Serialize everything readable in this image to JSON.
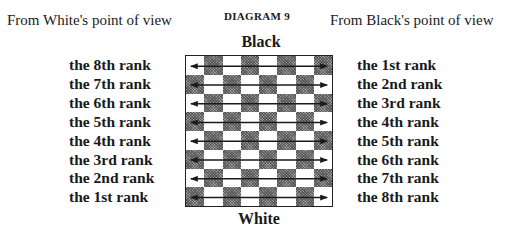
{
  "diagram": {
    "title": "DIAGRAM 9",
    "top_side_label": "Black",
    "bottom_side_label": "White",
    "left_header": "From White's point of view",
    "right_header": "From Black's point of view",
    "left_ranks": [
      "the 8th rank",
      "the 7th rank",
      "the 6th rank",
      "the 5th rank",
      "the 4th rank",
      "the 3rd rank",
      "the 2nd rank",
      "the 1st rank"
    ],
    "right_ranks": [
      "the 1st rank",
      "the 2nd rank",
      "the 3rd rank",
      "the 4th rank",
      "the 5th rank",
      "the 6th rank",
      "the 7th rank",
      "the 8th rank"
    ],
    "board": {
      "rows": 8,
      "cols": 8,
      "top_left_square": "light",
      "arrow_per_rank": "double-headed horizontal",
      "colors": {
        "dark_square": "#9a9a9a",
        "light_square": "#ffffff",
        "border": "#222222",
        "arrow": "#1a1a1a"
      }
    }
  }
}
